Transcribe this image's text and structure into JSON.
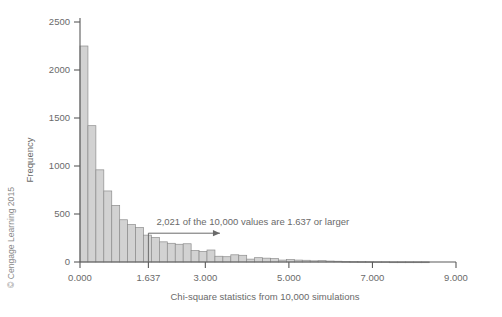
{
  "credit": "© Cengage Learning 2015",
  "chart_data": {
    "type": "bar",
    "title": "",
    "subtitle": "",
    "xlabel": "Chi-square statistics from 10,000 simulations",
    "ylabel": "Frequency",
    "xlim": [
      0.0,
      9.0
    ],
    "ylim": [
      0,
      2500
    ],
    "grid": false,
    "legend": null,
    "x_tick_labels": [
      "0.000",
      "1.637",
      "3.000",
      "5.000",
      "7.000",
      "9.000"
    ],
    "x_tick_values": [
      0.0,
      1.637,
      3.0,
      5.0,
      7.0,
      9.0
    ],
    "y_tick_labels": [
      "0",
      "500",
      "1000",
      "1500",
      "2000",
      "2500"
    ],
    "y_tick_values": [
      0,
      500,
      1000,
      1500,
      2000,
      2500
    ],
    "bin_width": 0.19,
    "bin_starts": [
      0.0,
      0.19,
      0.38,
      0.57,
      0.76,
      0.95,
      1.14,
      1.33,
      1.52,
      1.71,
      1.9,
      2.09,
      2.28,
      2.47,
      2.66,
      2.85,
      3.04,
      3.23,
      3.42,
      3.61,
      3.8,
      3.99,
      4.18,
      4.37,
      4.56,
      4.75,
      4.94,
      5.13,
      5.32,
      5.51,
      5.7,
      5.89,
      6.08,
      6.27,
      6.46,
      6.65,
      6.84,
      7.03,
      7.22,
      7.41,
      7.6,
      7.79,
      7.98,
      8.17
    ],
    "values": [
      2250,
      1420,
      960,
      740,
      590,
      440,
      390,
      360,
      280,
      255,
      210,
      195,
      185,
      190,
      120,
      110,
      125,
      60,
      55,
      75,
      70,
      30,
      45,
      40,
      35,
      20,
      25,
      20,
      18,
      12,
      14,
      10,
      8,
      6,
      5,
      4,
      3,
      2,
      2,
      1,
      1,
      1,
      1,
      1
    ],
    "annotations": [
      {
        "text": "2,021 of the 10,000 values are 1.637 or larger",
        "x": 1.637,
        "arrow_from": 1.637,
        "arrow_to": 3.35,
        "arrow_y": 300
      }
    ]
  }
}
